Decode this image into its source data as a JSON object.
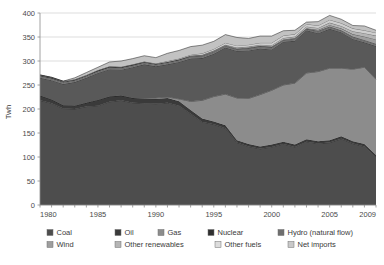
{
  "chart_data": {
    "type": "area",
    "title": "",
    "xlabel": "",
    "ylabel": "Twh",
    "xlim": [
      1980,
      2009
    ],
    "ylim": [
      0,
      400
    ],
    "grid": true,
    "legend_position": "bottom",
    "xticks": [
      "1980",
      "1985",
      "1990",
      "1995",
      "2000",
      "2005",
      "2009"
    ],
    "xtick_values": [
      1980,
      1985,
      1990,
      1995,
      2000,
      2005,
      2009
    ],
    "yticks": [
      "0",
      "50",
      "100",
      "150",
      "200",
      "250",
      "300",
      "350",
      "400"
    ],
    "ytick_values": [
      0,
      50,
      100,
      150,
      200,
      250,
      300,
      350,
      400
    ],
    "x": [
      1980,
      1981,
      1982,
      1983,
      1984,
      1985,
      1986,
      1987,
      1988,
      1989,
      1990,
      1991,
      1992,
      1993,
      1994,
      1995,
      1996,
      1997,
      1998,
      1999,
      2000,
      2001,
      2002,
      2003,
      2004,
      2005,
      2006,
      2007,
      2008,
      2009
    ],
    "series": [
      {
        "name": "Coal",
        "color": "#4d4d4d",
        "values": [
          218,
          212,
          201,
          200,
          205,
          207,
          215,
          218,
          213,
          212,
          211,
          213,
          207,
          190,
          173,
          168,
          160,
          130,
          122,
          117,
          121,
          127,
          121,
          132,
          128,
          130,
          138,
          128,
          122,
          99
        ]
      },
      {
        "name": "Oil",
        "color": "#3a3a3a",
        "values": [
          10,
          8,
          7,
          7,
          8,
          12,
          11,
          10,
          10,
          10,
          10,
          10,
          9,
          8,
          7,
          6,
          6,
          5,
          5,
          5,
          5,
          5,
          5,
          5,
          5,
          5,
          5,
          5,
          5,
          5
        ]
      },
      {
        "name": "Gas",
        "color": "#8c8c8c",
        "values": [
          0,
          0,
          0,
          0,
          0,
          0,
          0,
          0,
          0,
          1,
          2,
          2,
          5,
          18,
          38,
          52,
          65,
          88,
          95,
          108,
          113,
          118,
          128,
          138,
          145,
          150,
          142,
          150,
          160,
          158
        ]
      },
      {
        "name": "Nuclear",
        "color": "#595959",
        "values": [
          37,
          40,
          44,
          49,
          52,
          56,
          57,
          54,
          64,
          70,
          66,
          68,
          77,
          89,
          88,
          89,
          97,
          98,
          100,
          96,
          85,
          90,
          88,
          89,
          80,
          82,
          75,
          63,
          52,
          69
        ]
      },
      {
        "name": "Hydro (natural flow)",
        "color": "#6e6e6e",
        "values": [
          5,
          5,
          5,
          5,
          5,
          5,
          5,
          5,
          5,
          5,
          5,
          5,
          5,
          5,
          5,
          5,
          4,
          4,
          5,
          5,
          5,
          4,
          5,
          3,
          5,
          5,
          4,
          5,
          5,
          5
        ]
      },
      {
        "name": "Wind",
        "color": "#9e9e9e",
        "values": [
          0,
          0,
          0,
          0,
          0,
          0,
          0,
          0,
          0,
          0,
          0,
          0,
          0,
          1,
          1,
          1,
          1,
          1,
          1,
          1,
          1,
          1,
          1,
          1,
          2,
          3,
          4,
          5,
          7,
          9
        ]
      },
      {
        "name": "Other renewables",
        "color": "#b5b5b5",
        "values": [
          0,
          0,
          0,
          0,
          0,
          0,
          0,
          0,
          0,
          0,
          0,
          0,
          0,
          0,
          1,
          1,
          1,
          2,
          2,
          2,
          3,
          3,
          3,
          4,
          4,
          5,
          5,
          6,
          7,
          8
        ]
      },
      {
        "name": "Other fuels",
        "color": "#cfcfcf",
        "values": [
          1,
          1,
          1,
          1,
          1,
          1,
          1,
          1,
          1,
          1,
          1,
          2,
          2,
          2,
          3,
          3,
          4,
          4,
          4,
          4,
          5,
          5,
          5,
          5,
          5,
          6,
          6,
          6,
          6,
          6
        ]
      },
      {
        "name": "Net imports",
        "color": "#c2c2c2",
        "values": [
          0,
          0,
          0,
          3,
          5,
          6,
          9,
          12,
          12,
          12,
          12,
          16,
          17,
          17,
          17,
          16,
          17,
          17,
          13,
          14,
          14,
          10,
          8,
          4,
          8,
          9,
          8,
          6,
          9,
          5
        ]
      }
    ]
  },
  "legend": {
    "row1": [
      {
        "label": "Coal",
        "color": "#4d4d4d"
      },
      {
        "label": "Oil",
        "color": "#3a3a3a"
      },
      {
        "label": "Gas",
        "color": "#8c8c8c"
      },
      {
        "label": "Nuclear",
        "color": "#2f2f2f"
      },
      {
        "label": "Hydro (natural flow)",
        "color": "#6e6e6e"
      }
    ],
    "row2": [
      {
        "label": "Wind",
        "color": "#9e9e9e"
      },
      {
        "label": "Other renewables",
        "color": "#b5b5b5"
      },
      {
        "label": "Other fuels",
        "color": "#dcdcdc"
      },
      {
        "label": "Net imports",
        "color": "#c9c9c9"
      }
    ]
  }
}
